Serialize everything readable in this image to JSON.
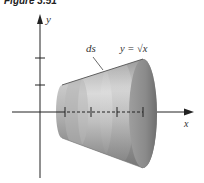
{
  "figure": {
    "caption": "Figure 3.51",
    "labels": {
      "y_axis": "y",
      "x_axis": "x",
      "ds": "ds",
      "curve": "y = √x"
    },
    "colors": {
      "surface_light": "#d4d4d4",
      "surface_mid": "#a9a9a9",
      "surface_dark": "#7c7c7c",
      "band_light": "#c8c8c8",
      "end_cap": "#8f8f8f",
      "axis": "#222222"
    },
    "x_axis_ticks": 4,
    "y_axis_ticks": 2
  }
}
